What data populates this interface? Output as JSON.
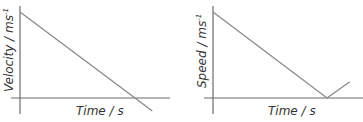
{
  "chart_data": [
    {
      "type": "line",
      "title": "",
      "xlabel": "Time / s",
      "ylabel": "Velocity / ms",
      "ylabel_superscript": "-1",
      "x": [
        0,
        1,
        1.15
      ],
      "series": [
        {
          "name": "velocity",
          "values": [
            1,
            0,
            -0.15
          ]
        }
      ],
      "xlim": [
        0,
        1.3
      ],
      "ylim": [
        -0.2,
        1.05
      ],
      "grid": false,
      "legend": "none",
      "note": "straight line decreasing through zero, crossing the time axis and continuing negative"
    },
    {
      "type": "line",
      "title": "",
      "xlabel": "Time / s",
      "ylabel": "Speed / ms",
      "ylabel_superscript": "-1",
      "x": [
        0,
        1,
        1.2
      ],
      "series": [
        {
          "name": "speed",
          "values": [
            1,
            0,
            0.19
          ]
        }
      ],
      "xlim": [
        0,
        1.3
      ],
      "ylim": [
        -0.2,
        1.05
      ],
      "grid": false,
      "legend": "none",
      "note": "speed decreases linearly to zero then increases (V shape)"
    }
  ]
}
